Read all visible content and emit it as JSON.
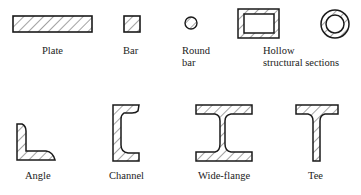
{
  "figure": {
    "sections": [
      {
        "id": "plate",
        "label": "Plate"
      },
      {
        "id": "bar",
        "label": "Bar"
      },
      {
        "id": "round-bar",
        "label_line1": "Round",
        "label_line2": "bar"
      },
      {
        "id": "hollow",
        "label_line1": "Hollow",
        "label_line2": "structural sections"
      },
      {
        "id": "angle",
        "label": "Angle"
      },
      {
        "id": "channel",
        "label": "Channel"
      },
      {
        "id": "wide-flange",
        "label": "Wide-flange"
      },
      {
        "id": "tee",
        "label": "Tee"
      }
    ],
    "colors": {
      "stroke": "#1a1a1a",
      "hatch": "#333333",
      "background": "#ffffff"
    }
  }
}
